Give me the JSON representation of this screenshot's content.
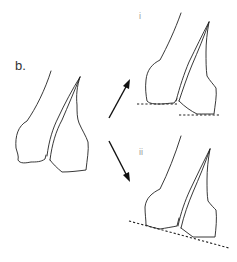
{
  "figure": {
    "panel_label": "b.",
    "subpanels": [
      {
        "id": "i",
        "label": "i",
        "baseline": "two separate horizontal dashed lines at different heights"
      },
      {
        "id": "ii",
        "label": "ii",
        "baseline": "single slanted dashed line"
      }
    ],
    "arrows": [
      {
        "name": "arrow-to-i",
        "direction": "up-right"
      },
      {
        "name": "arrow-to-ii",
        "direction": "down-right"
      }
    ],
    "colors": {
      "line": "#222222",
      "label": "#333333",
      "sublabel": "#9a9a9a",
      "background": "#ffffff"
    }
  }
}
